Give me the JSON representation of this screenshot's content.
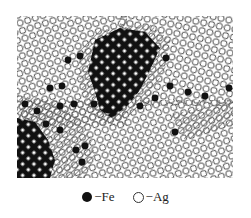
{
  "figure": {
    "colors": {
      "fe": "#111111",
      "ag_stroke": "#333333",
      "hatch": "#555555",
      "background": "#ffffff"
    }
  },
  "legend": {
    "items": [
      {
        "symbol": "filled-circle",
        "label": "−Fe"
      },
      {
        "symbol": "open-circle",
        "label": "−Ag"
      }
    ]
  }
}
